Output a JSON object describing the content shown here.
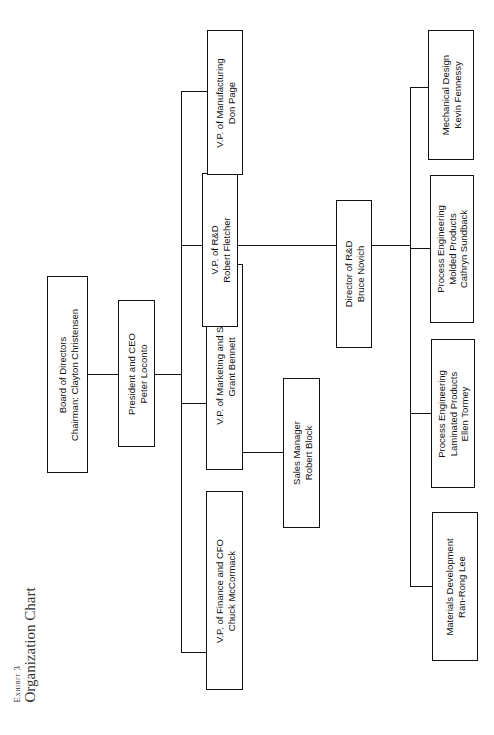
{
  "exhibit": {
    "label": "Exhibit 3",
    "title": "Organization Chart"
  },
  "nodes": {
    "board": {
      "role": "Board of Directors",
      "name": "Chairman: Clayton Christensen"
    },
    "ceo": {
      "role": "President and CEO",
      "name": "Peter Loconto"
    },
    "vp_finance": {
      "role": "V.P. of Finance and CFO",
      "name": "Chuck McCormack"
    },
    "vp_marketing": {
      "role": "V.P. of Marketing and Sales",
      "name": "Grant Bennett"
    },
    "vp_rd": {
      "role": "V.P. of R&D",
      "name": "Robert Fletcher"
    },
    "vp_manufacturing": {
      "role": "V.P. of Manufacturing",
      "name": "Don Page"
    },
    "sales_manager": {
      "role": "Sales Manager",
      "name": "Robert Block"
    },
    "director_rd": {
      "role": "Director of R&D",
      "name": "Bruce Novich"
    },
    "materials_dev": {
      "role": "Materials Development",
      "name": "Ran-Rong Lee"
    },
    "process_laminated": {
      "role": "Process Engineering",
      "sub": "Laminated Products",
      "name": "Ellen Tormey"
    },
    "process_molded": {
      "role": "Process Engineering",
      "sub": "Molded Products",
      "name": "Cathryn Sundback"
    },
    "mechanical_design": {
      "role": "Mechanical Design",
      "name": "Kevin Fennessy"
    }
  }
}
